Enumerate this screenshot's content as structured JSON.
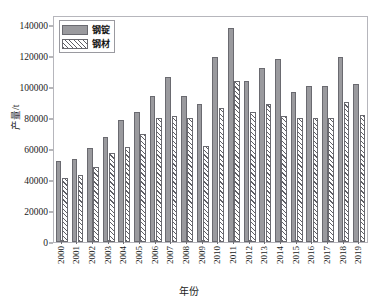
{
  "top_strip_text": "",
  "chart_data": {
    "type": "bar",
    "title": "",
    "xlabel": "年份",
    "ylabel": "产量/t",
    "ylim": [
      0,
      145000
    ],
    "yticks": [
      0,
      20000,
      40000,
      60000,
      80000,
      100000,
      120000,
      140000
    ],
    "ytick_labels": [
      "0",
      "20000",
      "40000",
      "60000",
      "80000",
      "100000",
      "120000",
      "140000"
    ],
    "grid": false,
    "legend_position": "upper-left",
    "categories": [
      "2000",
      "2001",
      "2002",
      "2003",
      "2004",
      "2005",
      "2006",
      "2007",
      "2008",
      "2009",
      "2010",
      "2011",
      "2012",
      "2013",
      "2014",
      "2015",
      "2016",
      "2017",
      "2018",
      "2019"
    ],
    "series": [
      {
        "name": "钢锭",
        "fill": "solid",
        "color": "#9a9a9e",
        "values": [
          52000,
          53500,
          60500,
          67500,
          78500,
          84000,
          94000,
          106500,
          94000,
          89000,
          119500,
          138000,
          104000,
          112000,
          118000,
          96500,
          100500,
          100500,
          119500,
          102000
        ]
      },
      {
        "name": "钢材",
        "fill": "hatch",
        "color": "#ffffff",
        "values": [
          41500,
          43500,
          48500,
          57500,
          61500,
          69500,
          80000,
          81000,
          80000,
          62000,
          86500,
          104000,
          83500,
          89000,
          81500,
          80000,
          80000,
          80000,
          90500,
          82000
        ]
      }
    ]
  }
}
